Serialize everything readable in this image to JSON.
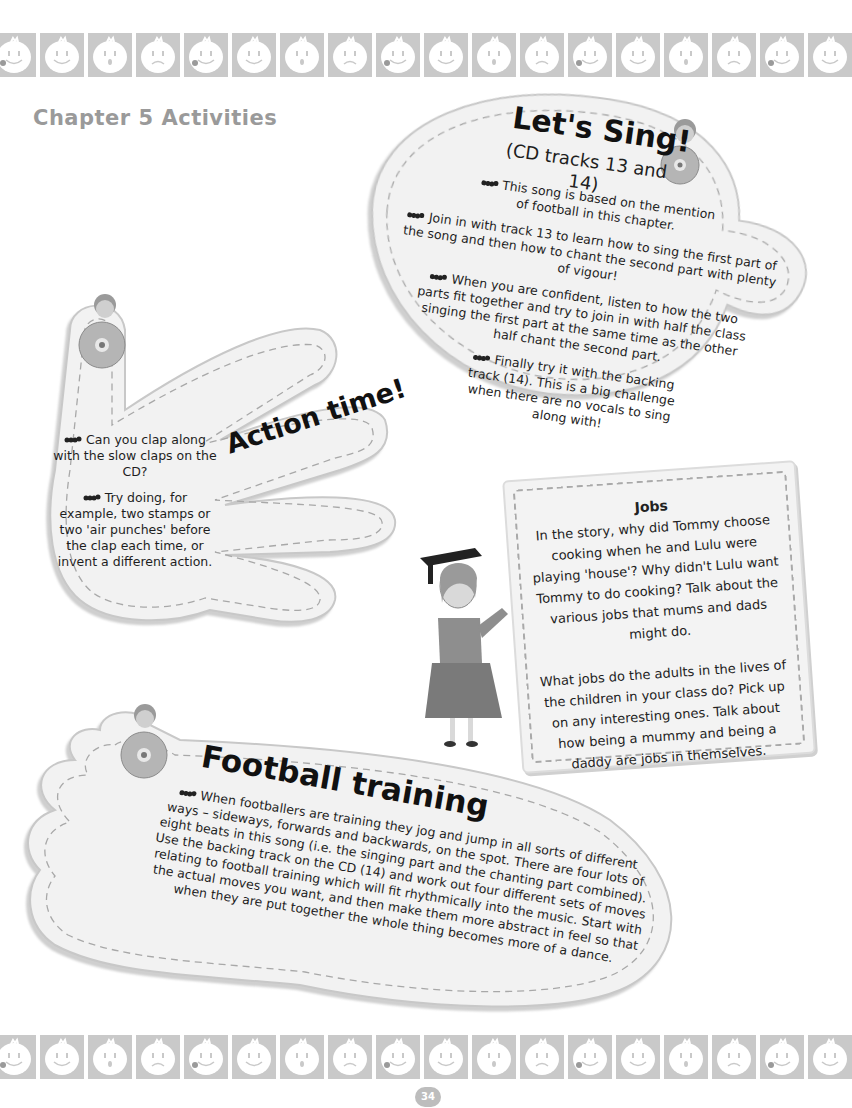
{
  "page": {
    "chapter_title": "Chapter 5 Activities",
    "page_number": "34"
  },
  "border": {
    "tile_color": "#c9c9c9",
    "face_icons": [
      "smile-tongue",
      "smile",
      "surprised",
      "sad",
      "smile-tongue",
      "smile",
      "surprised",
      "sad",
      "smile-tongue",
      "smile",
      "surprised",
      "sad",
      "smile-tongue",
      "smile",
      "surprised",
      "sad",
      "smile-tongue",
      "smile"
    ]
  },
  "lets_sing": {
    "title": "Let's Sing!",
    "subtitle": "(CD tracks 13 and 14)",
    "icon": "boy-with-cd-icon",
    "bullets": [
      "This song is based on the mention of football in this chapter.",
      "Join in with track 13 to learn how to sing the first part of the song and then how to chant the second part with plenty of vigour!",
      "When you are confident, listen to how the two parts fit together and try to join in with half the class singing the first part at the same time as the other half chant the second part.",
      "Finally try it with the backing track (14). This is a big challenge when there are no vocals to sing along with!"
    ]
  },
  "action_time": {
    "title": "Action time!",
    "icon": "boy-with-cd-icon",
    "bullets": [
      "Can you clap along with the slow claps on the CD?",
      "Try doing, for example, two stamps or two 'air punches' before the clap each time, or invent a different action."
    ]
  },
  "jobs": {
    "title": "Jobs",
    "icon": "teacher-graduate-icon",
    "paragraphs": [
      "In the story, why did Tommy choose cooking when he and Lulu were playing 'house'? Why didn't Lulu want Tommy to do cooking? Talk about the various jobs that mums and dads might do.",
      "What jobs do the adults in the lives of the children in your class do? Pick up on any interesting ones. Talk about how being a mummy and being a daddy are jobs in themselves."
    ]
  },
  "football_training": {
    "title": "Football training",
    "icon": "boy-with-cd-icon",
    "bullets": [
      "When footballers are training they jog and jump in all sorts of different ways – sideways, forwards and backwards, on the spot. There are four lots of eight beats in this song (i.e. the singing part and the chanting part combined). Use the backing track on the CD (14) and work out four different sets of moves relating to football training which will fit rhythmically into the music. Start with the actual moves you want, and then make them more abstract in feel so that when they are put together the whole thing becomes more of a dance."
    ]
  }
}
